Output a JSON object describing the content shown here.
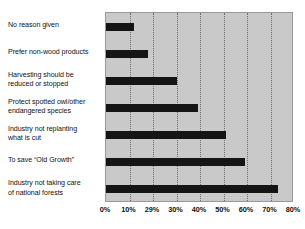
{
  "chart_data": {
    "type": "bar",
    "orientation": "horizontal",
    "title": "",
    "subtitle": "",
    "xlabel": "",
    "ylabel": "",
    "xlim": [
      0,
      80
    ],
    "grid": true,
    "legend": null,
    "categories": [
      "No reason given",
      "Prefer non-wood products",
      "Harvesting should be\nreduced or stopped",
      "Protect spotted owl/other\nendangered species",
      "Industry not replanting\nwhat is cut",
      "To save “Old Growth”",
      "Industry not taking care\nof national forests"
    ],
    "values": [
      12,
      18,
      30,
      39,
      51,
      59,
      73
    ],
    "value_unit": "%",
    "xticks": [
      0,
      10,
      20,
      30,
      40,
      50,
      60,
      70,
      80
    ],
    "xtick_labels": [
      "0%",
      "10%",
      "29%",
      "30%",
      "40%",
      "50%",
      "60%",
      "70%",
      "80%"
    ],
    "colors": {
      "bar": "#151515",
      "plot_background": "#c9c9c9",
      "page_background": "#ffffff",
      "gridline": "#6e6e6e",
      "plot_border": "#9a9a9a",
      "text": "#121212"
    }
  }
}
